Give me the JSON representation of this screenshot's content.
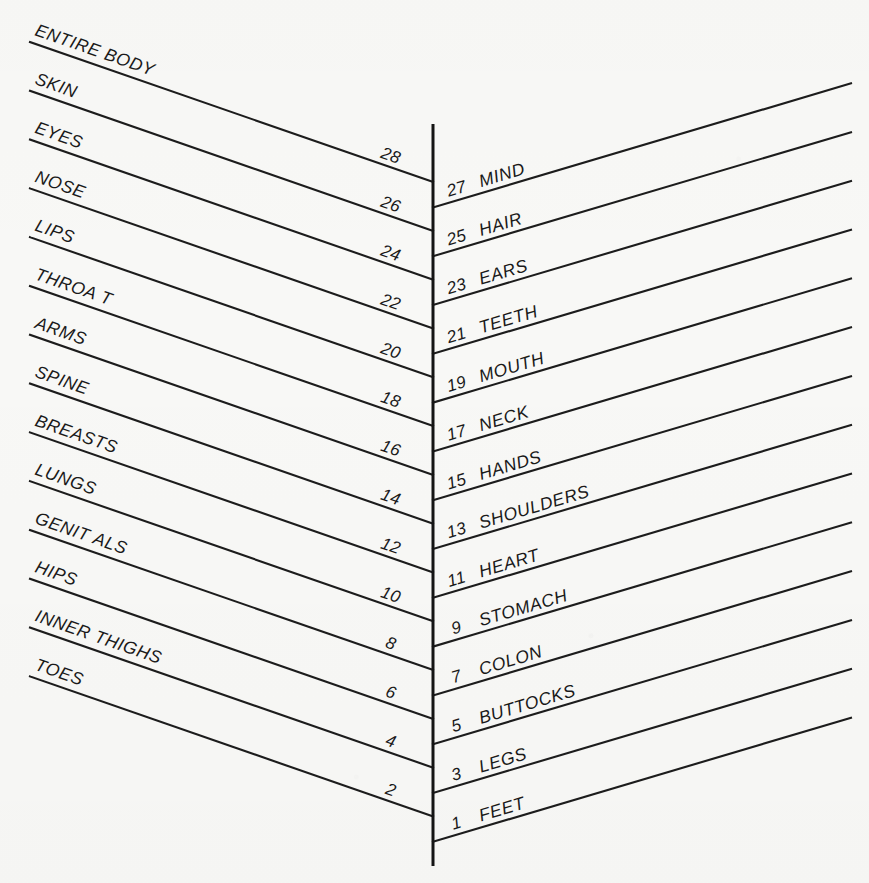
{
  "document": {
    "kind": "body-parts-chevron-chart",
    "background_color": "#f8f8f6",
    "ink_color": "#1a1a1a",
    "width": 869,
    "height": 883
  },
  "spine": {
    "name": "central-vertical-axis",
    "x": 433,
    "y_top": 124,
    "y_bottom": 866
  },
  "left_column": {
    "heading_note": "even-numbered rules, labels written above each rule, slanting down to the right",
    "rules": [
      {
        "number": "28",
        "label": "ENTIRE BODY",
        "labeled": true
      },
      {
        "number": "26",
        "label": "SKIN",
        "labeled": true
      },
      {
        "number": "24",
        "label": "EYES",
        "labeled": true
      },
      {
        "number": "22",
        "label": "NOSE",
        "labeled": true
      },
      {
        "number": "20",
        "label": "LIPS",
        "labeled": true
      },
      {
        "number": "18",
        "label": "THROA T",
        "labeled": true
      },
      {
        "number": "16",
        "label": "ARMS",
        "labeled": true
      },
      {
        "number": "14",
        "label": "SPINE",
        "labeled": true
      },
      {
        "number": "12",
        "label": "BREASTS",
        "labeled": true
      },
      {
        "number": "10",
        "label": "LUNGS",
        "labeled": true
      },
      {
        "number": "8",
        "label": "GENIT ALS",
        "labeled": true
      },
      {
        "number": "6",
        "label": "HIPS",
        "labeled": true
      },
      {
        "number": "4",
        "label": "INNER THIGHS",
        "labeled": true
      },
      {
        "number": "2",
        "label": "TOES",
        "labeled": true
      }
    ]
  },
  "right_column": {
    "heading_note": "odd-numbered rules, number then label, slanting up to the right",
    "rules": [
      {
        "number": "27",
        "label": "MIND"
      },
      {
        "number": "25",
        "label": "HAIR"
      },
      {
        "number": "23",
        "label": "EARS"
      },
      {
        "number": "21",
        "label": "TEETH"
      },
      {
        "number": "19",
        "label": "MOUTH"
      },
      {
        "number": "17",
        "label": "NECK"
      },
      {
        "number": "15",
        "label": "HANDS"
      },
      {
        "number": "13",
        "label": "SHOULDERS"
      },
      {
        "number": "11",
        "label": "HEART"
      },
      {
        "number": "9",
        "label": "STOMACH"
      },
      {
        "number": "7",
        "label": "COLON"
      },
      {
        "number": "5",
        "label": "BUTTOCKS"
      },
      {
        "number": "3",
        "label": "LEGS"
      },
      {
        "number": "1",
        "label": "FEET"
      }
    ]
  },
  "chart_data": {
    "type": "diagram",
    "title": "",
    "layout": "two-sided numbered rule ladder about a central vertical spine",
    "total_rules": 28,
    "left_numbers": [
      28,
      26,
      24,
      22,
      20,
      18,
      16,
      14,
      12,
      10,
      8,
      6,
      4,
      2
    ],
    "left_labels": [
      "ENTIRE BODY",
      "SKIN",
      "EYES",
      "NOSE",
      "LIPS",
      "THROA T",
      "ARMS",
      "SPINE",
      "BREASTS",
      "LUNGS",
      "GENIT ALS",
      "HIPS",
      "INNER THIGHS",
      "TOES"
    ],
    "right_numbers": [
      27,
      25,
      23,
      21,
      19,
      17,
      15,
      13,
      11,
      9,
      7,
      5,
      3,
      1
    ],
    "right_labels": [
      "MIND",
      "HAIR",
      "EARS",
      "TEETH",
      "MOUTH",
      "NECK",
      "HANDS",
      "SHOULDERS",
      "HEART",
      "STOMACH",
      "COLON",
      "BUTTOCKS",
      "LEGS",
      "FEET"
    ]
  }
}
